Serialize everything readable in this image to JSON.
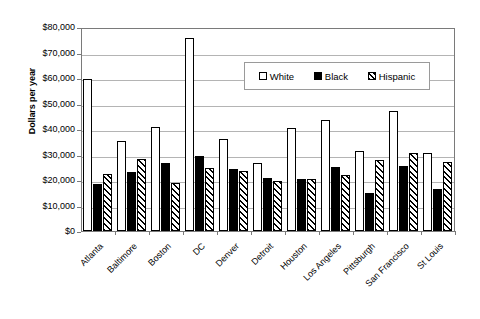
{
  "chart_data": {
    "type": "bar",
    "title": "",
    "xlabel": "",
    "ylabel": "Dollars per year",
    "ylim": [
      0,
      80000
    ],
    "ytick_labels": [
      "$0",
      "$10,000",
      "$20,000",
      "$30,000",
      "$40,000",
      "$50,000",
      "$60,000",
      "$70,000",
      "$80,000"
    ],
    "ytick_values": [
      0,
      10000,
      20000,
      30000,
      40000,
      50000,
      60000,
      70000,
      80000
    ],
    "grid": true,
    "legend_position": "upper-center-right",
    "categories": [
      "Atlanta",
      "Baltimore",
      "Boston",
      "DC",
      "Denver",
      "Detroit",
      "Houston",
      "Los Angeles",
      "Pittsburgh",
      "San Francisco",
      "St Louis"
    ],
    "series": [
      {
        "name": "White",
        "fill": "white",
        "values": [
          59700,
          35400,
          40800,
          75700,
          35900,
          26700,
          40300,
          43600,
          31500,
          47200,
          30700
        ]
      },
      {
        "name": "Black",
        "fill": "black",
        "values": [
          18400,
          23100,
          26800,
          29400,
          24200,
          20900,
          20300,
          25000,
          14800,
          25500,
          16500
        ]
      },
      {
        "name": "Hispanic",
        "fill": "hatched",
        "values": [
          22200,
          28300,
          19000,
          24600,
          23600,
          19800,
          20400,
          22000,
          27900,
          30500,
          27100
        ]
      }
    ]
  },
  "legend": {
    "items": [
      {
        "label": "White",
        "swatch": "white-square-icon"
      },
      {
        "label": "Black",
        "swatch": "black-square-icon"
      },
      {
        "label": "Hispanic",
        "swatch": "hatched-square-icon"
      }
    ]
  },
  "colors": {
    "axis": "#7a7a7a",
    "gridline": "#b4b4b4",
    "bar_outline": "#000000",
    "background": "#ffffff"
  }
}
